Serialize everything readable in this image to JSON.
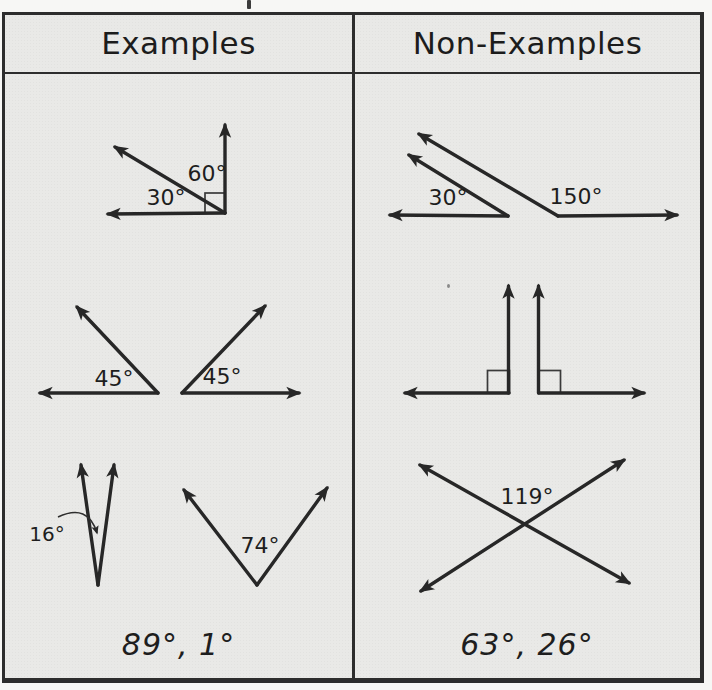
{
  "table": {
    "columns": [
      {
        "header": "Examples",
        "figures": [
          {
            "description": "adjacent angles forming a right angle",
            "labels": [
              "30°",
              "60°"
            ]
          },
          {
            "description": "two separate complementary angles",
            "labels": [
              "45°",
              "45°"
            ]
          },
          {
            "description": "narrow angle and wide angle pair",
            "labels": [
              "16°",
              "74°"
            ]
          }
        ],
        "footer": "89°, 1°"
      },
      {
        "header": "Non-Examples",
        "figures": [
          {
            "description": "supplementary-looking angle pair",
            "labels": [
              "30°",
              "150°"
            ]
          },
          {
            "description": "two right angles back to back",
            "labels": []
          },
          {
            "description": "crossing lines obtuse angle",
            "labels": [
              "119°"
            ]
          }
        ],
        "footer": "63°, 26°"
      }
    ]
  },
  "colors": {
    "ink": "#272727",
    "paper": "#e9e9e7",
    "page_background": "#f7f7f5",
    "border": "#2d2d2d"
  }
}
